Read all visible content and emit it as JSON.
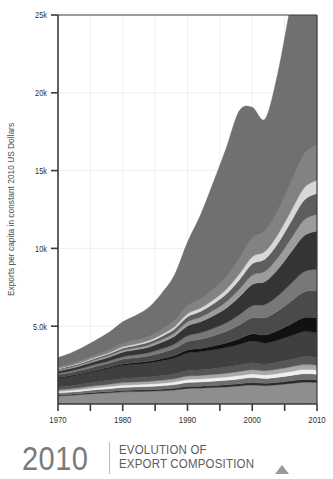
{
  "footer": {
    "year": "2010",
    "title_line1": "EVOLUTION OF",
    "title_line2": "EXPORT COMPOSITION",
    "arrow_icon": "triangle-up-icon",
    "divider_color": "#bdbdbd",
    "year_color": "#7a7a7a",
    "title_color": "#5c5c5c",
    "arrow_color": "#9a9a9a"
  },
  "chart_data": {
    "type": "area",
    "stacked": true,
    "title": "",
    "xlabel": "Years",
    "ylabel": "Exports per capita in constant 2010 US Dollars",
    "x": [
      1970,
      1972,
      1974,
      1976,
      1978,
      1980,
      1982,
      1984,
      1986,
      1988,
      1990,
      1992,
      1994,
      1996,
      1998,
      2000,
      2002,
      2004,
      2006,
      2008,
      2010
    ],
    "xlim": [
      1970,
      2010
    ],
    "ylim": [
      0,
      25000
    ],
    "xticks": [
      1970,
      1980,
      1990,
      2000,
      2010
    ],
    "xticklabels": [
      "1970",
      "1980",
      "1990",
      "2000",
      "2010"
    ],
    "xminorticks": [
      1975,
      1985,
      1995,
      2005
    ],
    "yticks": [
      5000,
      10000,
      15000,
      20000,
      25000
    ],
    "yticklabels": [
      "5.0k",
      "10k",
      "15k",
      "20k",
      "25k"
    ],
    "grid": true,
    "grid_color": "#efefef",
    "legend": "none",
    "axis_color": "#3a3a3a",
    "tick_label_color": "#2f2f2f",
    "axis_label_color": "#4a4a4a",
    "series": [
      {
        "name": "layer-01",
        "color": "#8e8e8e",
        "values": [
          520,
          560,
          620,
          680,
          720,
          780,
          800,
          820,
          850,
          900,
          1000,
          1020,
          1060,
          1100,
          1160,
          1220,
          1180,
          1240,
          1320,
          1400,
          1380
        ]
      },
      {
        "name": "layer-02",
        "color": "#2b2b2b",
        "values": [
          60,
          65,
          70,
          78,
          85,
          92,
          95,
          98,
          105,
          112,
          125,
          128,
          132,
          138,
          146,
          155,
          150,
          158,
          168,
          178,
          175
        ]
      },
      {
        "name": "layer-03",
        "color": "#6e6e6e",
        "values": [
          130,
          140,
          152,
          168,
          180,
          196,
          202,
          208,
          220,
          236,
          260,
          266,
          276,
          288,
          304,
          322,
          312,
          328,
          350,
          370,
          364
        ]
      },
      {
        "name": "layer-04",
        "color": "#efefef",
        "values": [
          95,
          102,
          112,
          122,
          132,
          142,
          148,
          152,
          162,
          172,
          190,
          195,
          202,
          210,
          222,
          236,
          228,
          240,
          256,
          272,
          266
        ]
      },
      {
        "name": "layer-05",
        "color": "#a8a8a8",
        "values": [
          110,
          118,
          128,
          140,
          152,
          164,
          170,
          175,
          186,
          198,
          220,
          225,
          233,
          243,
          256,
          272,
          263,
          276,
          295,
          312,
          306
        ]
      },
      {
        "name": "layer-06",
        "color": "#565656",
        "values": [
          180,
          195,
          212,
          232,
          250,
          272,
          280,
          290,
          308,
          328,
          364,
          372,
          386,
          402,
          425,
          450,
          435,
          458,
          488,
          518,
          508
        ]
      },
      {
        "name": "layer-07",
        "color": "#3f3f3f",
        "values": [
          560,
          600,
          655,
          715,
          775,
          840,
          866,
          896,
          952,
          1016,
          1126,
          1152,
          1194,
          1244,
          1314,
          1392,
          1346,
          1416,
          1510,
          1602,
          1572
        ]
      },
      {
        "name": "layer-08",
        "color": "#111111",
        "values": [
          40,
          44,
          50,
          58,
          68,
          82,
          92,
          104,
          124,
          150,
          190,
          215,
          250,
          300,
          370,
          460,
          520,
          620,
          760,
          900,
          980
        ]
      },
      {
        "name": "layer-09",
        "color": "#4a4a4a",
        "values": [
          180,
          196,
          216,
          240,
          268,
          300,
          320,
          345,
          390,
          450,
          540,
          590,
          660,
          750,
          880,
          1030,
          1110,
          1260,
          1460,
          1650,
          1740
        ]
      },
      {
        "name": "layer-10",
        "color": "#787878",
        "values": [
          95,
          105,
          118,
          134,
          152,
          176,
          192,
          212,
          248,
          296,
          370,
          412,
          470,
          546,
          656,
          780,
          846,
          970,
          1135,
          1295,
          1370
        ]
      },
      {
        "name": "layer-11",
        "color": "#343434",
        "values": [
          150,
          166,
          188,
          214,
          246,
          288,
          316,
          352,
          416,
          500,
          630,
          706,
          810,
          946,
          1146,
          1370,
          1490,
          1716,
          2020,
          2320,
          2462
        ]
      },
      {
        "name": "layer-12",
        "color": "#9c9c9c",
        "values": [
          60,
          67,
          76,
          87,
          100,
          118,
          130,
          146,
          174,
          210,
          266,
          300,
          346,
          406,
          494,
          592,
          645,
          745,
          880,
          1014,
          1078
        ]
      },
      {
        "name": "layer-13",
        "color": "#5e5e5e",
        "values": [
          70,
          78,
          89,
          102,
          118,
          139,
          154,
          173,
          207,
          251,
          320,
          362,
          419,
          494,
          604,
          727,
          794,
          921,
          1092,
          1262,
          1344
        ]
      },
      {
        "name": "layer-14",
        "color": "#d8d8d8",
        "values": [
          40,
          45,
          52,
          60,
          70,
          83,
          92,
          104,
          125,
          152,
          195,
          221,
          257,
          304,
          374,
          452,
          494,
          575,
          684,
          793,
          846
        ]
      },
      {
        "name": "layer-15",
        "color": "#828282",
        "values": [
          100,
          112,
          129,
          150,
          176,
          210,
          234,
          266,
          321,
          394,
          508,
          578,
          676,
          805,
          997,
          1212,
          1326,
          1548,
          1850,
          2152,
          2300
        ]
      },
      {
        "name": "layer-16",
        "color": "#707070",
        "values": [
          600,
          690,
          810,
          960,
          1150,
          1400,
          1600,
          1860,
          2320,
          2940,
          4100,
          5400,
          6900,
          8300,
          9500,
          8400,
          7200,
          8900,
          11500,
          13600,
          13900
        ]
      }
    ]
  }
}
